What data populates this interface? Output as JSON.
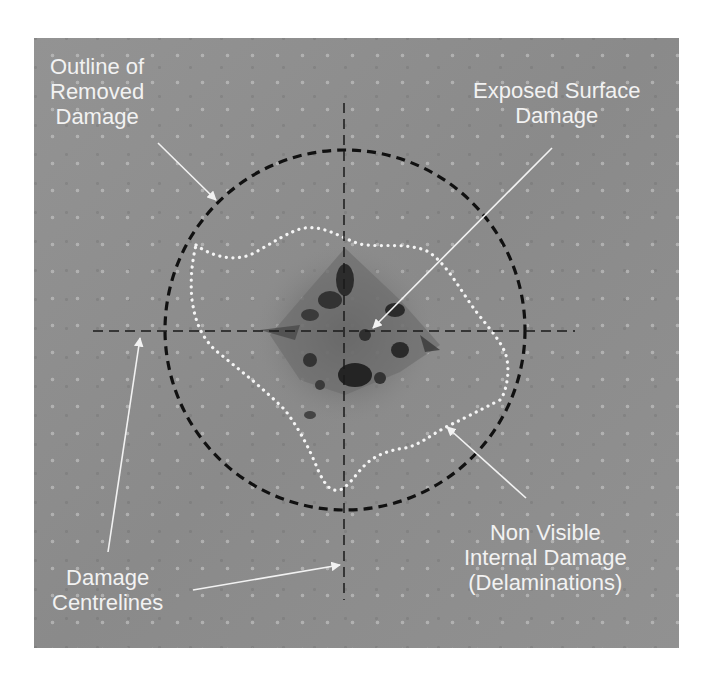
{
  "figure": {
    "photo_background": "#8f8f8f",
    "annotation_color": "#f2f2f2",
    "outline_color": "#111111"
  },
  "labels": {
    "outline_removed": {
      "line1": "Outline of",
      "line2": "Removed",
      "line3": "Damage"
    },
    "exposed_surface": {
      "line1": "Exposed Surface",
      "line2": "Damage"
    },
    "non_visible": {
      "line1": "Non Visible",
      "line2": "Internal Damage",
      "line3": "(Delaminations)"
    },
    "centrelines": {
      "line1": "Damage",
      "line2": "Centrelines"
    }
  },
  "geometry": {
    "circle": {
      "cx": 345,
      "cy": 330,
      "r": 180,
      "style": "black dashed"
    },
    "horizontal_centreline": {
      "x1": 93,
      "x2": 575,
      "y": 331
    },
    "vertical_centreline": {
      "x": 344,
      "y1": 103,
      "y2": 600
    },
    "delamination_outline": {
      "style": "white dotted"
    }
  }
}
